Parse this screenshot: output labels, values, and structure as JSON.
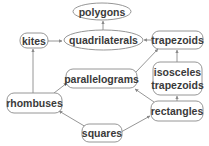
{
  "diagram": {
    "title": "",
    "nodes": [
      {
        "id": "polygons",
        "label": [
          "polygons"
        ],
        "shape": "ellipse"
      },
      {
        "id": "quadrilaterals",
        "label": [
          "quadrilaterals"
        ],
        "shape": "ellipse"
      },
      {
        "id": "kites",
        "label": [
          "kites"
        ],
        "shape": "rounded-rect"
      },
      {
        "id": "trapezoids",
        "label": [
          "trapezoids"
        ],
        "shape": "rounded-rect"
      },
      {
        "id": "isosceles-trapezoids",
        "label": [
          "isosceles",
          "trapezoids"
        ],
        "shape": "rounded-rect"
      },
      {
        "id": "parallelograms",
        "label": [
          "parallelograms"
        ],
        "shape": "rounded-rect"
      },
      {
        "id": "rhombuses",
        "label": [
          "rhombuses"
        ],
        "shape": "rounded-rect"
      },
      {
        "id": "rectangles",
        "label": [
          "rectangles"
        ],
        "shape": "rounded-rect"
      },
      {
        "id": "squares",
        "label": [
          "squares"
        ],
        "shape": "rounded-rect"
      }
    ],
    "edges": [
      {
        "from": "quadrilaterals",
        "to": "polygons"
      },
      {
        "from": "kites",
        "to": "quadrilaterals"
      },
      {
        "from": "trapezoids",
        "to": "quadrilaterals"
      },
      {
        "from": "parallelograms",
        "to": "trapezoids"
      },
      {
        "from": "isosceles-trapezoids",
        "to": "trapezoids"
      },
      {
        "from": "rhombuses",
        "to": "kites"
      },
      {
        "from": "rhombuses",
        "to": "parallelograms"
      },
      {
        "from": "rectangles",
        "to": "parallelograms"
      },
      {
        "from": "rectangles",
        "to": "isosceles-trapezoids"
      },
      {
        "from": "squares",
        "to": "rhombuses"
      },
      {
        "from": "squares",
        "to": "rectangles"
      }
    ]
  }
}
